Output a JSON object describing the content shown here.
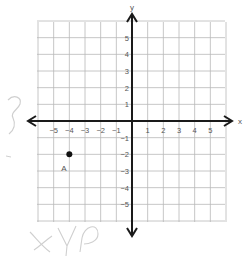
{
  "chart_data": {
    "type": "scatter",
    "title": "",
    "xlabel": "x",
    "ylabel": "y",
    "xlim": [
      -6,
      6
    ],
    "ylim": [
      -6,
      6
    ],
    "grid": true,
    "x_ticks": [
      -5,
      -4,
      -3,
      -2,
      -1,
      1,
      2,
      3,
      4,
      5
    ],
    "y_ticks": [
      5,
      4,
      3,
      2,
      1,
      -1,
      -2,
      -3,
      -4,
      -5
    ],
    "x_tick_labels": [
      "−5",
      "−4",
      "−3",
      "−2",
      "−1",
      "1",
      "2",
      "3",
      "4",
      "5"
    ],
    "y_tick_labels": [
      "5",
      "4",
      "3",
      "2",
      "1",
      "−1",
      "−2",
      "−3",
      "−4",
      "−5"
    ],
    "points": [
      {
        "label": "A",
        "x": -4,
        "y": -2
      }
    ]
  },
  "axes": {
    "x_label": "x",
    "y_label": "y"
  },
  "colors": {
    "grid": "#b8b8b8",
    "axis": "#1a1a1a",
    "point": "#111111",
    "label": "#555555",
    "handwriting": "#c9c9c9"
  },
  "handwriting": {
    "bottom_note": "+ y?"
  }
}
